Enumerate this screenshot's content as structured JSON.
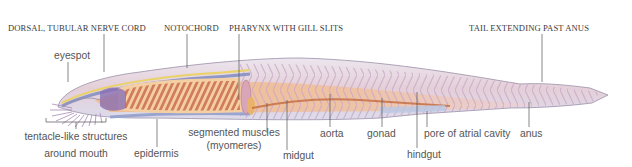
{
  "figure": {
    "colors": {
      "body_outline": "#9b8fa8",
      "body_fill": "#ece4ee",
      "nerve_cord": "#e9d26a",
      "notochord": "#8e97c6",
      "myomere": "#f0b27a",
      "pharynx_bar": "#c8694a",
      "gut": "#c46a3e",
      "label_line": "#555555"
    }
  },
  "labels": {
    "top": [
      {
        "id": "nerve_cord",
        "text": "DORSAL, TUBULAR NERVE CORD"
      },
      {
        "id": "notochord",
        "text": "NOTOCHORD"
      },
      {
        "id": "pharynx",
        "text": "PHARYNX WITH GILL SLITS"
      },
      {
        "id": "tail",
        "text": "TAIL EXTENDING PAST ANUS"
      }
    ],
    "bottom": {
      "eyespot": "eyespot",
      "tentacles_line1": "tentacle-like structures",
      "tentacles_line2": "around mouth",
      "epidermis": "epidermis",
      "muscles_line1": "segmented muscles",
      "muscles_line2": "(myomeres)",
      "midgut": "midgut",
      "aorta": "aorta",
      "gonad": "gonad",
      "hindgut": "hindgut",
      "pore": "pore of atrial cavity",
      "anus": "anus"
    }
  }
}
